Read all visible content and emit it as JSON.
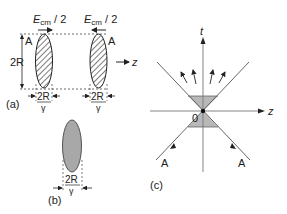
{
  "panel_a": {
    "label": "(a)",
    "beam_label_left": "E",
    "beam_label_sub": "cm",
    "beam_label_suffix": " / 2",
    "nucleus_left": "A",
    "nucleus_right": "A",
    "height_label": "2R",
    "width_num": "2R",
    "width_den": "γ",
    "axis_label": "z"
  },
  "panel_b": {
    "label": "(b)",
    "width_num": "2R",
    "width_den": "γ"
  },
  "panel_c": {
    "label": "(c)",
    "time_axis": "t",
    "space_axis": "z",
    "origin": "0",
    "incoming_left": "A",
    "incoming_right": "A"
  },
  "colors": {
    "ink": "#222222",
    "shade": "#b8b8b8",
    "ellipse_fill": "#a8a8a8",
    "axis_gray": "#777777"
  }
}
